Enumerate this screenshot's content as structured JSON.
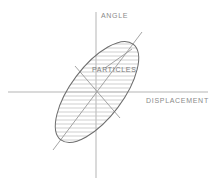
{
  "figure": {
    "title_visible": false,
    "background_color": "#ffffff",
    "width": 218,
    "height": 185
  },
  "axes": {
    "vertical": {
      "label": "ANGLE",
      "name": "angle-axis",
      "color": "#b5b5b5",
      "x": 96,
      "y_top": 12,
      "y_bottom": 178,
      "label_x": 101,
      "label_y": 18
    },
    "horizontal": {
      "label": "DISPLACEMENT",
      "name": "displacement-axis",
      "color": "#b5b5b5",
      "y": 92,
      "x_left": 8,
      "x_right": 208,
      "label_x": 146,
      "label_y": 103
    }
  },
  "ellipse": {
    "name": "phase-space-ellipse",
    "center_x": 97,
    "center_y": 92,
    "semi_major": 60,
    "semi_minor": 26,
    "rotation_deg": -53,
    "outline_color": "#6d6d6d",
    "hatch_color": "#c3c3c3",
    "hatch_spacing": 4
  },
  "principal_axes": {
    "major": {
      "name": "major-axis-line",
      "color": "#9a9a9a",
      "x1": 53,
      "y1": 150,
      "x2": 142,
      "y2": 32
    },
    "minor": {
      "name": "minor-axis-line",
      "color": "#9a9a9a",
      "x1": 75,
      "y1": 66,
      "x2": 120,
      "y2": 118
    }
  },
  "callout": {
    "label": "PARTICLES",
    "name": "particles-callout",
    "text_x": 92,
    "text_y": 72,
    "leader_color": "#9a9a9a",
    "leader_x1": 105,
    "leader_y1": 68,
    "leader_x2": 132,
    "leader_y2": 49
  },
  "colors": {
    "outline": "#6d6d6d",
    "hatch": "#c3c3c3",
    "axis": "#b5b5b5",
    "text": "#8a8a8a",
    "background": "#ffffff"
  }
}
